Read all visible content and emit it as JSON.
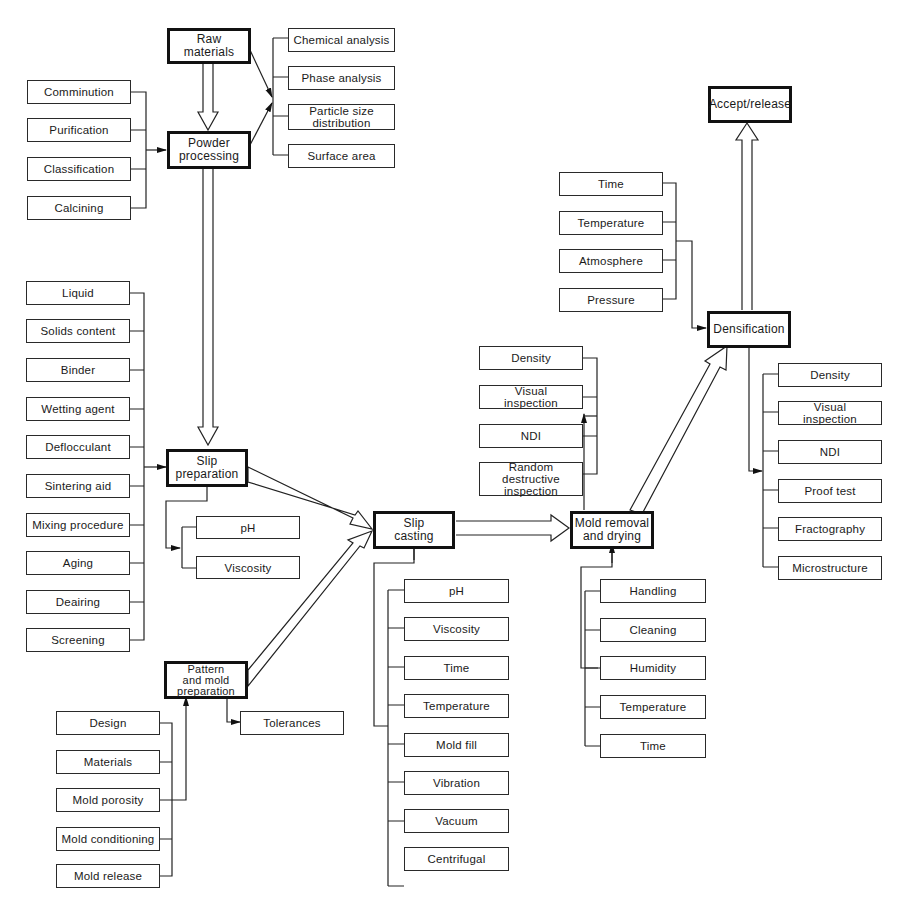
{
  "diagram": {
    "title": "",
    "main_steps": {
      "raw_materials": "Raw\nmaterials",
      "powder_processing": "Powder\nprocessing",
      "slip_preparation": "Slip\npreparation",
      "pattern_mold_preparation": "Pattern\nand mold\npreparation",
      "slip_casting": "Slip\ncasting",
      "mold_removal_drying": "Mold removal\nand drying",
      "densification": "Densification",
      "accept_release": "Accept/release"
    },
    "raw_material_tests": [
      "Chemical analysis",
      "Phase analysis",
      "Particle size\ndistribution",
      "Surface area"
    ],
    "powder_processing_inputs": [
      "Comminution",
      "Purification",
      "Classification",
      "Calcining"
    ],
    "slip_preparation_inputs": [
      "Liquid",
      "Solids content",
      "Binder",
      "Wetting agent",
      "Deflocculant",
      "Sintering aid",
      "Mixing procedure",
      "Aging",
      "Deairing",
      "Screening"
    ],
    "slip_preparation_outputs": [
      "pH",
      "Viscosity"
    ],
    "pattern_mold_inputs": [
      "Design",
      "Materials",
      "Mold porosity",
      "Mold conditioning",
      "Mold release"
    ],
    "pattern_mold_outputs": [
      "Tolerances"
    ],
    "slip_casting_inputs": [
      "pH",
      "Viscosity",
      "Time",
      "Temperature",
      "Mold fill",
      "Vibration",
      "Vacuum",
      "Centrifugal"
    ],
    "mold_removal_inputs": [
      "Handling",
      "Cleaning",
      "Humidity",
      "Temperature",
      "Time"
    ],
    "mold_removal_outputs": [
      "Density",
      "Visual\ninspection",
      "NDI",
      "Random\ndestructive\ninspection"
    ],
    "densification_inputs": [
      "Time",
      "Temperature",
      "Atmosphere",
      "Pressure"
    ],
    "densification_outputs": [
      "Density",
      "Visual\ninspection",
      "NDI",
      "Proof test",
      "Fractography",
      "Microstructure"
    ]
  }
}
